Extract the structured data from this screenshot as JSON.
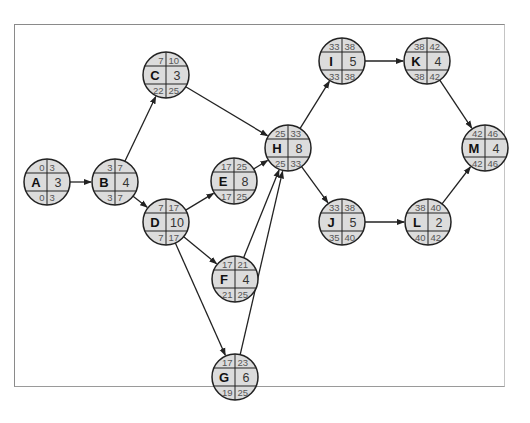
{
  "diagram": {
    "type": "network-diagram",
    "nodes": [
      {
        "id": "A",
        "duration": 3,
        "es": 0,
        "ef": 3,
        "ls": 0,
        "lf": 3,
        "x": 47,
        "y": 182
      },
      {
        "id": "B",
        "duration": 4,
        "es": 3,
        "ef": 7,
        "ls": 3,
        "lf": 7,
        "x": 115,
        "y": 182
      },
      {
        "id": "C",
        "duration": 3,
        "es": 7,
        "ef": 10,
        "ls": 22,
        "lf": 25,
        "x": 166,
        "y": 75
      },
      {
        "id": "D",
        "duration": 10,
        "es": 7,
        "ef": 17,
        "ls": 7,
        "lf": 17,
        "x": 166,
        "y": 222
      },
      {
        "id": "E",
        "duration": 8,
        "es": 17,
        "ef": 25,
        "ls": 17,
        "lf": 25,
        "x": 234,
        "y": 181
      },
      {
        "id": "F",
        "duration": 4,
        "es": 17,
        "ef": 21,
        "ls": 21,
        "lf": 25,
        "x": 235,
        "y": 279
      },
      {
        "id": "G",
        "duration": 6,
        "es": 17,
        "ef": 23,
        "ls": 19,
        "lf": 25,
        "x": 235,
        "y": 377
      },
      {
        "id": "H",
        "duration": 8,
        "es": 25,
        "ef": 33,
        "ls": 25,
        "lf": 33,
        "x": 288,
        "y": 148
      },
      {
        "id": "I",
        "duration": 5,
        "es": 33,
        "ef": 38,
        "ls": 33,
        "lf": 38,
        "x": 342,
        "y": 61
      },
      {
        "id": "J",
        "duration": 5,
        "es": 33,
        "ef": 38,
        "ls": 35,
        "lf": 40,
        "x": 342,
        "y": 222
      },
      {
        "id": "K",
        "duration": 4,
        "es": 38,
        "ef": 42,
        "ls": 38,
        "lf": 42,
        "x": 427,
        "y": 61
      },
      {
        "id": "L",
        "duration": 2,
        "es": 38,
        "ef": 40,
        "ls": 40,
        "lf": 42,
        "x": 428,
        "y": 222
      },
      {
        "id": "M",
        "duration": 4,
        "es": 42,
        "ef": 46,
        "ls": 42,
        "lf": 46,
        "x": 485,
        "y": 148
      }
    ],
    "edges": [
      [
        "A",
        "B"
      ],
      [
        "B",
        "C"
      ],
      [
        "B",
        "D"
      ],
      [
        "C",
        "H"
      ],
      [
        "D",
        "E"
      ],
      [
        "D",
        "F"
      ],
      [
        "D",
        "G"
      ],
      [
        "E",
        "H"
      ],
      [
        "F",
        "H"
      ],
      [
        "G",
        "H"
      ],
      [
        "H",
        "I"
      ],
      [
        "H",
        "J"
      ],
      [
        "I",
        "K"
      ],
      [
        "J",
        "L"
      ],
      [
        "K",
        "M"
      ],
      [
        "L",
        "M"
      ]
    ]
  }
}
